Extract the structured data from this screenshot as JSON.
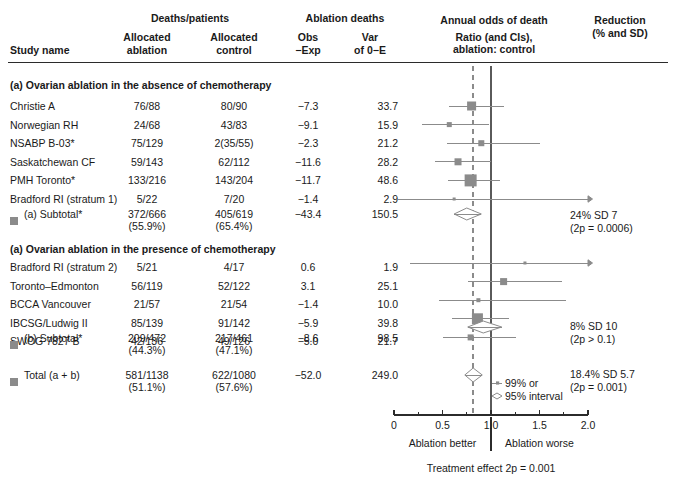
{
  "header": {
    "group_deaths": "Deaths/patients",
    "group_ablation_deaths": "Ablation deaths",
    "group_annual_odds": "Annual odds of death",
    "group_annual_odds_sub1": "Ratio (and CIs),",
    "group_annual_odds_sub2": "ablation: control",
    "group_reduction1": "Reduction",
    "group_reduction2": "(% and SD)",
    "col_study": "Study name",
    "col_alloc_abl1": "Allocated",
    "col_alloc_abl2": "ablation",
    "col_alloc_ctl1": "Allocated",
    "col_alloc_ctl2": "control",
    "col_obs1": "Obs",
    "col_obs2": "−Exp",
    "col_var1": "Var",
    "col_var2": "of 0−E"
  },
  "sections": [
    {
      "title": "(a) Ovarian ablation in the absence of chemotherapy",
      "rows": [
        {
          "name": "Christie A",
          "ablation": "76/88",
          "control": "80/90",
          "obs_exp": "−7.3",
          "var": "33.7",
          "or": 0.8,
          "lo": 0.57,
          "hi": 1.13,
          "size": 9,
          "arrow_right": false,
          "arrow_left": false
        },
        {
          "name": "Norwegian RH",
          "ablation": "24/68",
          "control": "43/83",
          "obs_exp": "−9.1",
          "var": "15.9",
          "or": 0.57,
          "lo": 0.29,
          "hi": 0.98,
          "size": 5,
          "arrow_right": false,
          "arrow_left": false
        },
        {
          "name": "NSABP B-03*",
          "ablation": "75/129",
          "control": "2(35/55)",
          "obs_exp": "−2.3",
          "var": "21.2",
          "or": 0.9,
          "lo": 0.55,
          "hi": 1.5,
          "size": 6,
          "arrow_right": false,
          "arrow_left": false
        },
        {
          "name": "Saskatchewan CF",
          "ablation": "59/143",
          "control": "62/112",
          "obs_exp": "−11.6",
          "var": "28.2",
          "or": 0.66,
          "lo": 0.42,
          "hi": 1.0,
          "size": 7,
          "arrow_right": false,
          "arrow_left": false
        },
        {
          "name": "PMH Toronto*",
          "ablation": "133/216",
          "control": "143/204",
          "obs_exp": "−11.7",
          "var": "48.6",
          "or": 0.79,
          "lo": 0.56,
          "hi": 1.09,
          "size": 12,
          "arrow_right": false,
          "arrow_left": false
        },
        {
          "name": "Bradford RI (stratum 1)",
          "ablation": "5/22",
          "control": "7/20",
          "obs_exp": "−1.4",
          "var": "2.9",
          "or": 0.62,
          "lo": 0.04,
          "hi": 2.0,
          "size": 3,
          "arrow_right": true,
          "arrow_left": false
        }
      ],
      "subtotal": {
        "label": "(a) Subtotal*",
        "ablation": "372/666",
        "ablation_pct": "(55.9%)",
        "control": "405/619",
        "control_pct": "(65.4%)",
        "obs_exp": "−43.4",
        "var": "150.5",
        "or": 0.75,
        "lo": 0.62,
        "hi": 0.9,
        "reduction": "24% SD 7",
        "p_value": "(2p = 0.0006)"
      }
    },
    {
      "title": "(a) Ovarian ablation in the presence of chemotherapy",
      "rows": [
        {
          "name": "Bradford RI (stratum 2)",
          "ablation": "5/21",
          "control": "4/17",
          "obs_exp": "0.6",
          "var": "1.9",
          "or": 1.35,
          "lo": 0.16,
          "hi": 2.0,
          "size": 3,
          "arrow_right": true,
          "arrow_left": false
        },
        {
          "name": "Toronto–Edmonton",
          "ablation": "56/119",
          "control": "52/122",
          "obs_exp": "3.1",
          "var": "25.1",
          "or": 1.13,
          "lo": 0.76,
          "hi": 1.73,
          "size": 7,
          "arrow_right": false,
          "arrow_left": false
        },
        {
          "name": "BCCA Vancouver",
          "ablation": "21/57",
          "control": "21/54",
          "obs_exp": "−1.4",
          "var": "10.0",
          "or": 0.87,
          "lo": 0.46,
          "hi": 1.77,
          "size": 4,
          "arrow_right": false,
          "arrow_left": false
        },
        {
          "name": "IBCSG/Ludwig II",
          "ablation": "85/139",
          "control": "91/142",
          "obs_exp": "−5.9",
          "var": "39.8",
          "or": 0.86,
          "lo": 0.6,
          "hi": 1.19,
          "size": 11,
          "arrow_right": false,
          "arrow_left": false
        },
        {
          "name": "SWOG 7827 B",
          "ablation": "42/136",
          "control": "49/126",
          "obs_exp": "−5.0",
          "var": "21.7",
          "or": 0.79,
          "lo": 0.5,
          "hi": 1.26,
          "size": 6,
          "arrow_right": false,
          "arrow_left": false
        }
      ],
      "subtotal": {
        "label": "(b) Subtotal*",
        "ablation": "209/472",
        "ablation_pct": "(44.3%)",
        "control": "217/461",
        "control_pct": "(47.1%)",
        "obs_exp": "−8.6",
        "var": "98.5",
        "or": 0.92,
        "lo": 0.76,
        "hi": 1.11,
        "reduction": "8% SD 10",
        "p_value": "(2p > 0.1)"
      }
    }
  ],
  "total": {
    "label": "Total (a + b)",
    "ablation": "581/1138",
    "ablation_pct": "(51.1%)",
    "control": "622/1080",
    "control_pct": "(57.6%)",
    "obs_exp": "−52.0",
    "var": "249.0",
    "or": 0.816,
    "lo": 0.73,
    "hi": 0.91,
    "reduction": "18.4% SD 5.7",
    "p_value": "(2p = 0.001)"
  },
  "axis": {
    "ticks": [
      {
        "value": 0.0,
        "label": "0"
      },
      {
        "value": 0.5,
        "label": "0.5"
      },
      {
        "value": 1.0,
        "label": "1.0"
      },
      {
        "value": 1.5,
        "label": "1.5"
      },
      {
        "value": 2.0,
        "label": "2.0"
      }
    ],
    "minor_ticks": [
      0.25,
      0.75,
      1.25,
      1.75
    ],
    "min": 0.0,
    "max": 2.0,
    "null_value": 1.0,
    "pooled_line": 0.816,
    "left_label": "Ablation better",
    "right_label": "Ablation worse",
    "footnote": "Treatment effect 2p = 0.001"
  },
  "legend": {
    "item_99": "99% or",
    "item_95": "95% interval"
  },
  "colors": {
    "marker": "#8b8b8b",
    "line": "#8b8b8b",
    "axis": "#2b2b2b",
    "text": "#1a1a1a"
  },
  "chart_data": {
    "type": "scatter",
    "xlabel": "Odds ratio (ablation : control)",
    "ylabel": "Study name",
    "xlim": [
      0.0,
      2.0
    ],
    "grid": false,
    "legend_position": "bottom-right",
    "null_line": 1.0,
    "pooled_line": 0.816,
    "series": [
      {
        "name": "Christie A",
        "or": 0.8,
        "ci_low": 0.57,
        "ci_high": 1.13,
        "weight": 33.7
      },
      {
        "name": "Norwegian RH",
        "or": 0.57,
        "ci_low": 0.29,
        "ci_high": 0.98,
        "weight": 15.9
      },
      {
        "name": "NSABP B-03*",
        "or": 0.9,
        "ci_low": 0.55,
        "ci_high": 1.5,
        "weight": 21.2
      },
      {
        "name": "Saskatchewan CF",
        "or": 0.66,
        "ci_low": 0.42,
        "ci_high": 1.0,
        "weight": 28.2
      },
      {
        "name": "PMH Toronto*",
        "or": 0.79,
        "ci_low": 0.56,
        "ci_high": 1.09,
        "weight": 48.6
      },
      {
        "name": "Bradford RI (stratum 1)",
        "or": 0.62,
        "ci_low": 0.04,
        "ci_high": 2.6,
        "weight": 2.9
      },
      {
        "name": "(a) Subtotal*",
        "or": 0.75,
        "ci_low": 0.62,
        "ci_high": 0.9,
        "weight": 150.5
      },
      {
        "name": "Bradford RI (stratum 2)",
        "or": 1.35,
        "ci_low": 0.16,
        "ci_high": 2.6,
        "weight": 1.9
      },
      {
        "name": "Toronto–Edmonton",
        "or": 1.13,
        "ci_low": 0.76,
        "ci_high": 1.73,
        "weight": 25.1
      },
      {
        "name": "BCCA Vancouver",
        "or": 0.87,
        "ci_low": 0.46,
        "ci_high": 1.77,
        "weight": 10.0
      },
      {
        "name": "IBCSG/Ludwig II",
        "or": 0.86,
        "ci_low": 0.6,
        "ci_high": 1.19,
        "weight": 39.8
      },
      {
        "name": "SWOG 7827 B",
        "or": 0.79,
        "ci_low": 0.5,
        "ci_high": 1.26,
        "weight": 21.7
      },
      {
        "name": "(b) Subtotal*",
        "or": 0.92,
        "ci_low": 0.76,
        "ci_high": 1.11,
        "weight": 98.5
      },
      {
        "name": "Total (a + b)",
        "or": 0.816,
        "ci_low": 0.73,
        "ci_high": 0.91,
        "weight": 249.0
      }
    ]
  }
}
